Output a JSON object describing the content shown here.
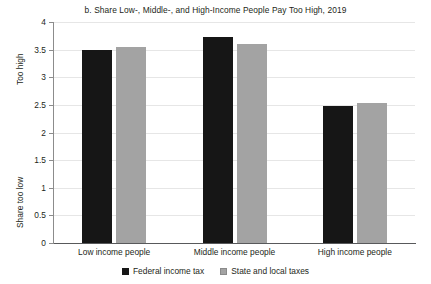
{
  "chart_data": {
    "type": "bar",
    "title": "b. Share Low-, Middle-, and High-Income People Pay Too High, 2019",
    "xlabel": "",
    "ylabel_top": "Too high",
    "ylabel_bottom": "Share too low",
    "categories": [
      "Low income people",
      "Middle income people",
      "High income people"
    ],
    "series": [
      {
        "name": "Federal income tax",
        "color": "#161616",
        "values": [
          3.5,
          3.72,
          2.48
        ]
      },
      {
        "name": "State and local taxes",
        "color": "#a3a3a3",
        "values": [
          3.55,
          3.61,
          2.53
        ]
      }
    ],
    "ylim": [
      0,
      4
    ],
    "yticks": [
      "0",
      "0.5",
      "1",
      "1.5",
      "2",
      "2.5",
      "3",
      "3.5",
      "4"
    ],
    "ytick_values": [
      0,
      0.5,
      1,
      1.5,
      2,
      2.5,
      3,
      3.5,
      4
    ],
    "grid": true,
    "legend_position": "bottom"
  }
}
